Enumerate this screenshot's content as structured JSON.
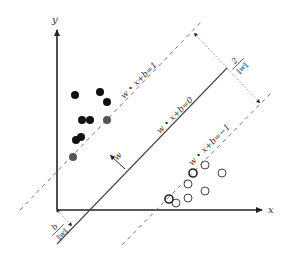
{
  "figure": {
    "axes": {
      "x_label": "x",
      "y_label": "y"
    },
    "lines": {
      "hyperplane_label": "w • x+b=0",
      "upper_margin_label": "w • x+b=1",
      "lower_margin_label": "w • x+b=−1"
    },
    "annotations": {
      "margin_width_num": "2",
      "margin_width_den": "‖w‖",
      "offset_num": "b",
      "offset_den": "‖w‖",
      "normal_vector_label": "w"
    },
    "classes": {
      "positive": {
        "style": "filled",
        "color": "#111111",
        "support_vector_color": "#555555"
      },
      "negative": {
        "style": "open",
        "color": "#444444"
      }
    },
    "points_filled": [
      [
        75,
        95
      ],
      [
        100,
        92
      ],
      [
        107,
        102
      ],
      [
        82,
        120
      ],
      [
        90,
        120
      ],
      [
        76,
        140
      ],
      [
        81,
        137
      ]
    ],
    "support_filled": [
      [
        107,
        120
      ],
      [
        73,
        157
      ]
    ],
    "points_open": [
      [
        205,
        165
      ],
      [
        222,
        173
      ],
      [
        188,
        184
      ],
      [
        205,
        191
      ],
      [
        176,
        203
      ],
      [
        188,
        198
      ]
    ],
    "support_open": [
      [
        193,
        173
      ],
      [
        169,
        199
      ]
    ]
  }
}
